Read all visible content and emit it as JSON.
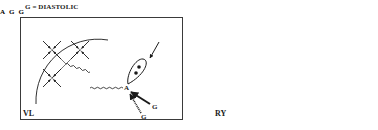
{
  "figure": {
    "title": "G = DIASTOLIC",
    "connector_symbol": "⇔",
    "panels": [
      {
        "id": "left",
        "label": "VL",
        "cell_markers": 3,
        "nucleus_dots": 2,
        "arrows": [
          {
            "label": "",
            "style": "solid",
            "direction": "toward-cell"
          },
          {
            "label": "G",
            "style": "solid",
            "direction": "toward-junction"
          },
          {
            "label": "G",
            "style": "hatched",
            "direction": "toward-junction"
          }
        ],
        "arc_dot": false
      },
      {
        "id": "right",
        "label": "RY",
        "cell_markers": 3,
        "nucleus_dots": 1,
        "arrows": [
          {
            "label": "G",
            "style": "solid",
            "direction": "away-from-junction"
          },
          {
            "label": "G",
            "style": "hatched",
            "direction": "away-from-junction"
          }
        ],
        "arc_dot": true
      }
    ],
    "colors": {
      "ink": "#1a1a1a",
      "background": "#ffffff",
      "frame": "#3a3a3a"
    }
  }
}
